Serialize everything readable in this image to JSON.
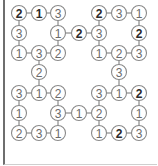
{
  "puzzle": {
    "type": "number-loop-grid",
    "colors": {
      "line": "#8a8a8a",
      "circle_border": "#8a8a8a",
      "digit": "#6a6a6a",
      "digit_bold": "#2a2a2a",
      "frame": "#6e6e6e"
    },
    "columns_x": [
      19,
      39,
      58,
      79,
      99,
      119,
      139
    ],
    "rows_y": [
      13,
      33,
      53,
      72,
      93,
      113,
      133
    ],
    "nodes": [
      {
        "r": 0,
        "c": 0,
        "v": "2",
        "bold": true
      },
      {
        "r": 0,
        "c": 1,
        "v": "1",
        "bold": true
      },
      {
        "r": 0,
        "c": 2,
        "v": "3",
        "bold": false
      },
      {
        "r": 0,
        "c": 4,
        "v": "2",
        "bold": true
      },
      {
        "r": 0,
        "c": 5,
        "v": "3",
        "bold": false
      },
      {
        "r": 0,
        "c": 6,
        "v": "1",
        "bold": false
      },
      {
        "r": 1,
        "c": 0,
        "v": "3",
        "bold": false
      },
      {
        "r": 1,
        "c": 2,
        "v": "1",
        "bold": false
      },
      {
        "r": 1,
        "c": 3,
        "v": "2",
        "bold": true
      },
      {
        "r": 1,
        "c": 4,
        "v": "3",
        "bold": false
      },
      {
        "r": 1,
        "c": 6,
        "v": "2",
        "bold": true
      },
      {
        "r": 2,
        "c": 0,
        "v": "1",
        "bold": false
      },
      {
        "r": 2,
        "c": 1,
        "v": "3",
        "bold": false
      },
      {
        "r": 2,
        "c": 2,
        "v": "2",
        "bold": false
      },
      {
        "r": 2,
        "c": 4,
        "v": "1",
        "bold": false
      },
      {
        "r": 2,
        "c": 5,
        "v": "2",
        "bold": false
      },
      {
        "r": 2,
        "c": 6,
        "v": "3",
        "bold": false
      },
      {
        "r": 3,
        "c": 1,
        "v": "2",
        "bold": false
      },
      {
        "r": 3,
        "c": 5,
        "v": "3",
        "bold": false
      },
      {
        "r": 4,
        "c": 0,
        "v": "3",
        "bold": false
      },
      {
        "r": 4,
        "c": 1,
        "v": "1",
        "bold": false
      },
      {
        "r": 4,
        "c": 2,
        "v": "2",
        "bold": false
      },
      {
        "r": 4,
        "c": 4,
        "v": "3",
        "bold": false
      },
      {
        "r": 4,
        "c": 5,
        "v": "1",
        "bold": false
      },
      {
        "r": 4,
        "c": 6,
        "v": "2",
        "bold": true
      },
      {
        "r": 5,
        "c": 0,
        "v": "1",
        "bold": false
      },
      {
        "r": 5,
        "c": 2,
        "v": "3",
        "bold": false
      },
      {
        "r": 5,
        "c": 3,
        "v": "1",
        "bold": false
      },
      {
        "r": 5,
        "c": 4,
        "v": "2",
        "bold": false
      },
      {
        "r": 5,
        "c": 6,
        "v": "1",
        "bold": false
      },
      {
        "r": 6,
        "c": 0,
        "v": "2",
        "bold": false
      },
      {
        "r": 6,
        "c": 1,
        "v": "3",
        "bold": false
      },
      {
        "r": 6,
        "c": 2,
        "v": "1",
        "bold": false
      },
      {
        "r": 6,
        "c": 4,
        "v": "1",
        "bold": false
      },
      {
        "r": 6,
        "c": 5,
        "v": "2",
        "bold": true
      },
      {
        "r": 6,
        "c": 6,
        "v": "3",
        "bold": false
      }
    ],
    "edges": [
      [
        [
          0,
          0
        ],
        [
          0,
          1
        ]
      ],
      [
        [
          0,
          1
        ],
        [
          0,
          2
        ]
      ],
      [
        [
          0,
          4
        ],
        [
          0,
          5
        ]
      ],
      [
        [
          0,
          5
        ],
        [
          0,
          6
        ]
      ],
      [
        [
          1,
          2
        ],
        [
          1,
          3
        ]
      ],
      [
        [
          1,
          3
        ],
        [
          1,
          4
        ]
      ],
      [
        [
          2,
          0
        ],
        [
          2,
          1
        ]
      ],
      [
        [
          2,
          1
        ],
        [
          2,
          2
        ]
      ],
      [
        [
          2,
          4
        ],
        [
          2,
          5
        ]
      ],
      [
        [
          2,
          5
        ],
        [
          2,
          6
        ]
      ],
      [
        [
          4,
          0
        ],
        [
          4,
          1
        ]
      ],
      [
        [
          4,
          1
        ],
        [
          4,
          2
        ]
      ],
      [
        [
          4,
          4
        ],
        [
          4,
          5
        ]
      ],
      [
        [
          4,
          5
        ],
        [
          4,
          6
        ]
      ],
      [
        [
          5,
          2
        ],
        [
          5,
          3
        ]
      ],
      [
        [
          5,
          3
        ],
        [
          5,
          4
        ]
      ],
      [
        [
          6,
          0
        ],
        [
          6,
          1
        ]
      ],
      [
        [
          6,
          1
        ],
        [
          6,
          2
        ]
      ],
      [
        [
          6,
          4
        ],
        [
          6,
          5
        ]
      ],
      [
        [
          6,
          5
        ],
        [
          6,
          6
        ]
      ],
      [
        [
          0,
          0
        ],
        [
          1,
          0
        ]
      ],
      [
        [
          1,
          0
        ],
        [
          2,
          0
        ]
      ],
      [
        [
          0,
          2
        ],
        [
          1,
          2
        ]
      ],
      [
        [
          1,
          2
        ],
        [
          2,
          2
        ]
      ],
      [
        [
          0,
          4
        ],
        [
          1,
          4
        ]
      ],
      [
        [
          1,
          4
        ],
        [
          2,
          4
        ]
      ],
      [
        [
          0,
          6
        ],
        [
          1,
          6
        ]
      ],
      [
        [
          1,
          6
        ],
        [
          2,
          6
        ]
      ],
      [
        [
          2,
          1
        ],
        [
          3,
          1
        ]
      ],
      [
        [
          3,
          1
        ],
        [
          4,
          1
        ]
      ],
      [
        [
          2,
          5
        ],
        [
          3,
          5
        ]
      ],
      [
        [
          3,
          5
        ],
        [
          4,
          5
        ]
      ],
      [
        [
          4,
          0
        ],
        [
          5,
          0
        ]
      ],
      [
        [
          5,
          0
        ],
        [
          6,
          0
        ]
      ],
      [
        [
          4,
          2
        ],
        [
          5,
          2
        ]
      ],
      [
        [
          5,
          2
        ],
        [
          6,
          2
        ]
      ],
      [
        [
          4,
          4
        ],
        [
          5,
          4
        ]
      ],
      [
        [
          5,
          4
        ],
        [
          6,
          4
        ]
      ],
      [
        [
          4,
          6
        ],
        [
          5,
          6
        ]
      ],
      [
        [
          5,
          6
        ],
        [
          6,
          6
        ]
      ]
    ]
  }
}
